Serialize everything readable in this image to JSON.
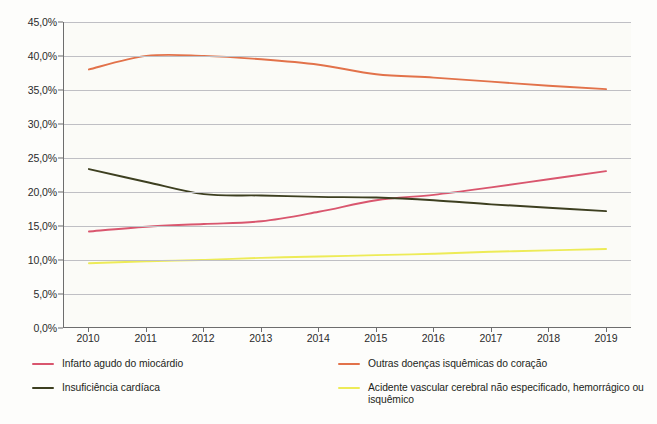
{
  "chart_data": {
    "type": "line",
    "title": "",
    "subtitle": "",
    "xlabel": "",
    "ylabel": "",
    "grid": true,
    "legend_position": "bottom",
    "x": [
      2010,
      2011,
      2012,
      2013,
      2014,
      2015,
      2016,
      2017,
      2018,
      2019
    ],
    "categories": [
      "2010",
      "2011",
      "2012",
      "2013",
      "2014",
      "2015",
      "2016",
      "2017",
      "2018",
      "2019"
    ],
    "ylim": [
      0,
      45
    ],
    "ytick_values": [
      0,
      5,
      10,
      15,
      20,
      25,
      30,
      35,
      40,
      45
    ],
    "ytick_labels": [
      "0,0%",
      "5,0%",
      "10,0%",
      "15,0%",
      "20,0%",
      "25,0%",
      "30,0%",
      "35,0%",
      "40,0%",
      "45,0%"
    ],
    "series": [
      {
        "name": "Infarto agudo do miocárdio",
        "color": "#D9566E",
        "values": [
          14.1,
          14.8,
          15.2,
          15.6,
          17.0,
          18.7,
          19.5,
          20.6,
          21.8,
          23.0
        ]
      },
      {
        "name": "Insuficiência cardíaca",
        "color": "#3D3F20",
        "values": [
          23.3,
          21.4,
          19.6,
          19.4,
          19.2,
          19.1,
          18.7,
          18.1,
          17.6,
          17.1
        ]
      },
      {
        "name": "Outras doenças isquêmicas do coração",
        "color": "#E2724A",
        "values": [
          38.0,
          40.0,
          40.0,
          39.5,
          38.7,
          37.3,
          36.8,
          36.2,
          35.6,
          35.1
        ]
      },
      {
        "name": "Acidente vascular cerebral não especificado, hemorrágico ou isquêmico",
        "color": "#EDEB57",
        "values": [
          9.4,
          9.7,
          9.9,
          10.2,
          10.4,
          10.6,
          10.8,
          11.1,
          11.3,
          11.5
        ]
      }
    ]
  },
  "legend": {
    "items": [
      {
        "label": "Infarto agudo do miocárdio",
        "color": "#D9566E"
      },
      {
        "label": "Insuficiência cardíaca",
        "color": "#3D3F20"
      },
      {
        "label": "Outras doenças isquêmicas do coração",
        "color": "#E2724A"
      },
      {
        "label": "Acidente vascular cerebral não especificado, hemorrágico ou isquêmico",
        "color": "#EDEB57"
      }
    ]
  },
  "colors": {
    "axis": "#6d6d6d",
    "grid": "#bfbfc4",
    "plot_background": "#fbfbf7",
    "page_background": "#fdfdfb",
    "text": "#231f20"
  }
}
